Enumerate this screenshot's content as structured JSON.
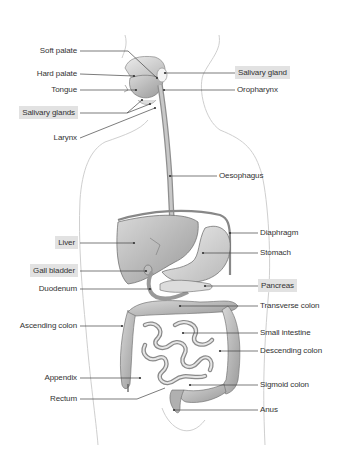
{
  "diagram": {
    "highlight_color": "#e2e2e2",
    "line_color": "#444444",
    "labels_left": [
      {
        "id": "soft-palate",
        "text": "Soft palate",
        "boxed": false
      },
      {
        "id": "hard-palate",
        "text": "Hard palate",
        "boxed": false
      },
      {
        "id": "tongue",
        "text": "Tongue",
        "boxed": false
      },
      {
        "id": "salivary-glands",
        "text": "Salivary glands",
        "boxed": true
      },
      {
        "id": "larynx",
        "text": "Larynx",
        "boxed": false
      },
      {
        "id": "liver",
        "text": "Liver",
        "boxed": true
      },
      {
        "id": "gall-bladder",
        "text": "Gall bladder",
        "boxed": true
      },
      {
        "id": "duodenum",
        "text": "Duodenum",
        "boxed": false
      },
      {
        "id": "ascending-colon",
        "text": "Ascending colon",
        "boxed": false
      },
      {
        "id": "appendix",
        "text": "Appendix",
        "boxed": false
      },
      {
        "id": "rectum",
        "text": "Rectum",
        "boxed": false
      }
    ],
    "labels_right": [
      {
        "id": "salivary-gland",
        "text": "Salivary gland",
        "boxed": true
      },
      {
        "id": "oropharynx",
        "text": "Oropharynx",
        "boxed": false
      },
      {
        "id": "oesophagus",
        "text": "Oesophagus",
        "boxed": false
      },
      {
        "id": "diaphragm",
        "text": "Diaphragm",
        "boxed": false
      },
      {
        "id": "stomach",
        "text": "Stomach",
        "boxed": false
      },
      {
        "id": "pancreas",
        "text": "Pancreas",
        "boxed": true
      },
      {
        "id": "transverse-colon",
        "text": "Transverse colon",
        "boxed": false
      },
      {
        "id": "small-intestine",
        "text": "Small intestine",
        "boxed": false
      },
      {
        "id": "descending-colon",
        "text": "Descending colon",
        "boxed": false
      },
      {
        "id": "sigmoid-colon",
        "text": "Sigmoid colon",
        "boxed": false
      },
      {
        "id": "anus",
        "text": "Anus",
        "boxed": false
      }
    ]
  }
}
